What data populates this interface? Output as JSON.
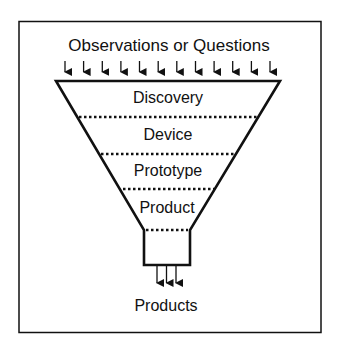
{
  "diagram": {
    "type": "funnel",
    "input_label": "Observations or Questions",
    "output_label": "Products",
    "stages": [
      {
        "label": "Discovery"
      },
      {
        "label": "Device"
      },
      {
        "label": "Prototype"
      },
      {
        "label": "Product"
      }
    ],
    "input_arrow_count": 12,
    "output_arrow_count": 3,
    "colors": {
      "stroke": "#111111",
      "background": "#ffffff"
    }
  }
}
